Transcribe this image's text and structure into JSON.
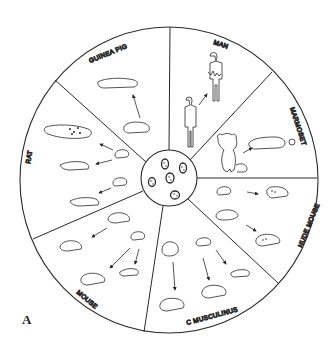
{
  "figure": {
    "panel_label": "A",
    "center_label": "tumor cells",
    "colors": {
      "ink": "#2a2a2a",
      "background": "#ffffff"
    },
    "sectors": [
      {
        "label": "MAN",
        "content": "human figure with tumor"
      },
      {
        "label": "MARMOSET",
        "content": "marmoset transferring to tumor-bearing host"
      },
      {
        "label": "NUDE MOUSE",
        "content": "nude mice with tumors"
      },
      {
        "label": "C MUSCULINUS",
        "content": "mice with tumors"
      },
      {
        "label": "MOUSE",
        "content": "mice with tumors"
      },
      {
        "label": "RAT",
        "content": "rats with tumors"
      },
      {
        "label": "GUINEA PIG",
        "content": "guinea pig to host"
      }
    ]
  }
}
